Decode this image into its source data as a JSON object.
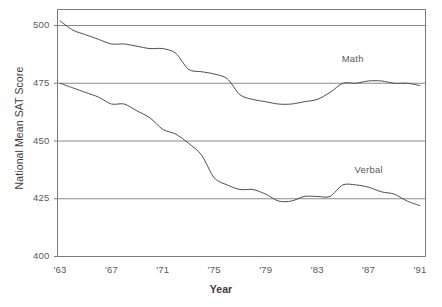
{
  "chart_data": {
    "type": "line",
    "title": "",
    "xlabel": "Year",
    "ylabel": "National Mean SAT Score",
    "xlim": [
      1963,
      1991
    ],
    "ylim": [
      400,
      500
    ],
    "ytick_labels": [
      "500",
      "475",
      "450",
      "425",
      "400"
    ],
    "ytick_values": [
      500,
      475,
      450,
      425,
      400
    ],
    "xtick_labels": [
      "'63",
      "'67",
      "'71",
      "'75",
      "'79",
      "'83",
      "'87",
      "'91"
    ],
    "xtick_values": [
      1963,
      1967,
      1971,
      1975,
      1979,
      1983,
      1987,
      1991
    ],
    "grid": "horizontal",
    "legend_position": "inline-annotation",
    "x": [
      1963,
      1964,
      1965,
      1966,
      1967,
      1968,
      1969,
      1970,
      1971,
      1972,
      1973,
      1974,
      1975,
      1976,
      1977,
      1978,
      1979,
      1980,
      1981,
      1982,
      1983,
      1984,
      1985,
      1986,
      1987,
      1988,
      1989,
      1990,
      1991
    ],
    "series": [
      {
        "name": "Math",
        "color": "#4d4d4d",
        "values": [
          502,
          498,
          496,
          494,
          492,
          492,
          491,
          490,
          490,
          488,
          481,
          480,
          479,
          477,
          470,
          468,
          467,
          466,
          466,
          467,
          468,
          471,
          475,
          475,
          476,
          476,
          475,
          475,
          474
        ]
      },
      {
        "name": "Verbal",
        "color": "#4d4d4d",
        "values": [
          475,
          473,
          471,
          469,
          466,
          466,
          463,
          460,
          455,
          453,
          449,
          444,
          434,
          431,
          429,
          429,
          427,
          424,
          424,
          426,
          426,
          426,
          431,
          431,
          430,
          428,
          427,
          424,
          422
        ]
      }
    ],
    "annotations": [
      {
        "text": "Math",
        "x": 1986,
        "y": 485
      },
      {
        "text": "Verbal",
        "x": 1987,
        "y": 437
      }
    ]
  }
}
